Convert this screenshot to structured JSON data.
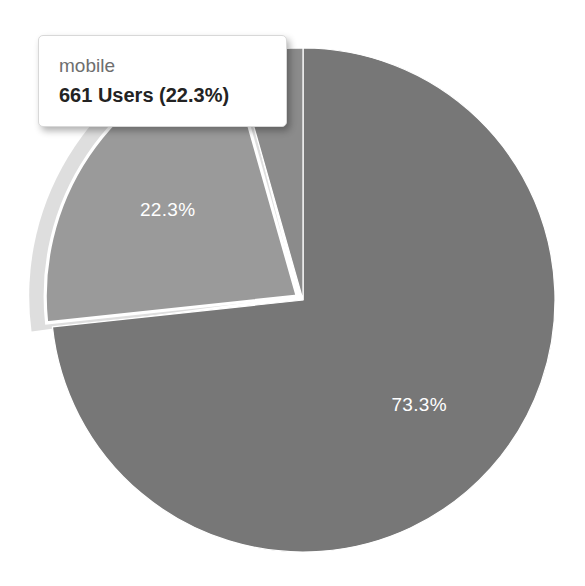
{
  "chart_data": {
    "type": "pie",
    "title": "",
    "xlabel": "",
    "ylabel": "",
    "unit": "Users",
    "legend_position": "none",
    "grid": false,
    "total_users": 2964,
    "categories": [
      "desktop",
      "mobile",
      "tablet"
    ],
    "values": [
      2172,
      661,
      131
    ],
    "percentages": [
      73.3,
      22.3,
      4.4
    ],
    "labels": [
      "73.3%",
      "22.3%",
      "4.4%"
    ],
    "colors": [
      "#777777",
      "#9a9a9a",
      "#8b8b8b"
    ],
    "slices": [
      {
        "name": "desktop",
        "value": 2172,
        "percent": 73.3,
        "label": "73.3%",
        "color": "#777777",
        "label_visible": true,
        "highlighted": false
      },
      {
        "name": "mobile",
        "value": 661,
        "percent": 22.3,
        "label": "22.3%",
        "color": "#9a9a9a",
        "label_visible": true,
        "highlighted": true
      },
      {
        "name": "tablet",
        "value": 131,
        "percent": 4.4,
        "label": "4.4%",
        "color": "#8b8b8b",
        "label_visible": false,
        "highlighted": false
      }
    ],
    "geometry": {
      "center_x": 303,
      "center_y": 300,
      "radius": 252,
      "start_angle_deg": 0,
      "highlight_halo_radius": 268,
      "highlight_stroke_color": "#ffffff",
      "halo_color": "#dedede",
      "separator_color": "#ffffff"
    }
  },
  "tooltip": {
    "visible": true,
    "title": "mobile",
    "value_text": "661 Users (22.3%)",
    "count": 661,
    "unit": "Users",
    "percent_text": "22.3%",
    "background_color": "#ffffff",
    "title_color": "#6e6e6e",
    "value_color": "#232323"
  },
  "canvas": {
    "background_color": "#ffffff",
    "width": 585,
    "height": 586
  }
}
